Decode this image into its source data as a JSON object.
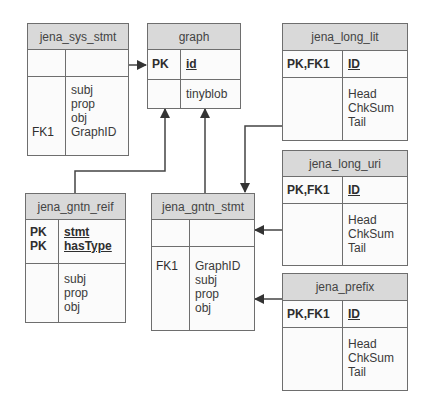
{
  "tables": {
    "jena_sys_stmt": {
      "name": "jena_sys_stmt",
      "pk_keys": [
        ""
      ],
      "pk_fields": [
        ""
      ],
      "keys": [
        "",
        "",
        "",
        "FK1"
      ],
      "fields": [
        "subj",
        "prop",
        "obj",
        "GraphID"
      ]
    },
    "graph": {
      "name": "graph",
      "pk_keys": [
        "PK"
      ],
      "pk_fields": [
        "id"
      ],
      "keys": [
        ""
      ],
      "fields": [
        "tinyblob"
      ]
    },
    "jena_long_lit": {
      "name": "jena_long_lit",
      "pk_keys": [
        "PK,FK1"
      ],
      "pk_fields": [
        "ID"
      ],
      "keys": [
        "",
        "",
        ""
      ],
      "fields": [
        "Head",
        "ChkSum",
        "Tail"
      ]
    },
    "jena_long_uri": {
      "name": "jena_long_uri",
      "pk_keys": [
        "PK,FK1"
      ],
      "pk_fields": [
        "ID"
      ],
      "keys": [
        "",
        "",
        ""
      ],
      "fields": [
        "Head",
        "ChkSum",
        "Tail"
      ]
    },
    "jena_prefix": {
      "name": "jena_prefix",
      "pk_keys": [
        "PK,FK1"
      ],
      "pk_fields": [
        "ID"
      ],
      "keys": [
        "",
        "",
        ""
      ],
      "fields": [
        "Head",
        "ChkSum",
        "Tail"
      ]
    },
    "jena_gntn_reif": {
      "name": "jena_gntn_reif",
      "pk_keys": [
        "PK",
        "PK"
      ],
      "pk_fields": [
        "stmt",
        "hasType"
      ],
      "keys": [
        "",
        "",
        ""
      ],
      "fields": [
        "subj",
        "prop",
        "obj"
      ]
    },
    "jena_gntn_stmt": {
      "name": "jena_gntn_stmt",
      "pk_keys": [
        ""
      ],
      "pk_fields": [
        ""
      ],
      "keys": [
        "FK1",
        "",
        "",
        ""
      ],
      "fields": [
        "GraphID",
        "subj",
        "prop",
        "obj"
      ]
    }
  },
  "relationships": [
    {
      "from": "jena_sys_stmt",
      "to": "graph"
    },
    {
      "from": "jena_gntn_reif",
      "to": "graph"
    },
    {
      "from": "jena_gntn_stmt",
      "to": "graph"
    },
    {
      "from": "jena_long_lit",
      "to": "jena_gntn_stmt"
    },
    {
      "from": "jena_long_uri",
      "to": "jena_gntn_stmt"
    },
    {
      "from": "jena_prefix",
      "to": "jena_gntn_stmt"
    }
  ],
  "colors": {
    "header_bg": "#d9d9d9",
    "border": "#6e6e6e",
    "line": "#444444"
  }
}
